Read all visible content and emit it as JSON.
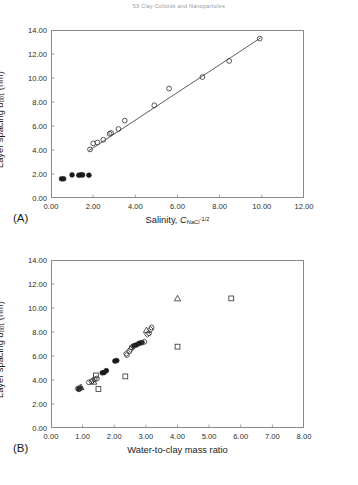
{
  "header": {
    "running_text": "53  Clay Colloids and Nanoparticles"
  },
  "panels": [
    {
      "id": "A",
      "label": "(A)",
      "ylabel_prefix": "Layer spacing ",
      "ylabel_symbol": "d",
      "ylabel_sub": "001",
      "ylabel_units": " (nm)",
      "xlabel_prefix": "Salinity, ",
      "xlabel_symbol": "C",
      "xlabel_sub": "NaCl",
      "xlabel_sup": "-1/2",
      "xticks": [
        "0.00",
        "2.00",
        "4.00",
        "6.00",
        "8.00",
        "10.00",
        "12.00"
      ],
      "yticks": [
        "0.00",
        "2.00",
        "4.00",
        "6.00",
        "8.00",
        "10.00",
        "12.00",
        "14.00"
      ]
    },
    {
      "id": "B",
      "label": "(B)",
      "ylabel_prefix": "Layer spacing ",
      "ylabel_symbol": "d",
      "ylabel_sub": "001",
      "ylabel_units": " (nm)",
      "xlabel_text": "Water-to-clay mass ratio",
      "xticks": [
        "0.00",
        "1.00",
        "2.00",
        "3.00",
        "4.00",
        "5.00",
        "6.00",
        "7.00",
        "8.00"
      ],
      "yticks": [
        "0.00",
        "2.00",
        "4.00",
        "6.00",
        "8.00",
        "10.00",
        "12.00",
        "14.00"
      ]
    }
  ],
  "chart_data": [
    {
      "type": "scatter",
      "panel": "A",
      "title": "",
      "xlabel": "Salinity, C_NaCl^(-1/2)",
      "ylabel": "Layer spacing d_001 (nm)",
      "xlim": [
        0.0,
        12.0
      ],
      "ylim": [
        0.0,
        14.0
      ],
      "xticks": [
        0,
        2,
        4,
        6,
        8,
        10,
        12
      ],
      "yticks": [
        0,
        2,
        4,
        6,
        8,
        10,
        12,
        14
      ],
      "grid": false,
      "legend": "none",
      "series": [
        {
          "name": "open-circle-swelling",
          "marker": "circle-open",
          "points": [
            [
              1.85,
              4.05
            ],
            [
              2.0,
              4.55
            ],
            [
              2.2,
              4.62
            ],
            [
              2.48,
              4.85
            ],
            [
              2.78,
              5.35
            ],
            [
              2.85,
              5.42
            ],
            [
              3.2,
              5.75
            ],
            [
              3.5,
              6.45
            ],
            [
              4.9,
              7.72
            ],
            [
              5.6,
              9.12
            ],
            [
              7.18,
              10.08
            ],
            [
              8.45,
              11.42
            ],
            [
              9.9,
              13.28
            ]
          ]
        },
        {
          "name": "filled-circle-crystalline",
          "marker": "circle-filled",
          "points": [
            [
              0.5,
              1.6
            ],
            [
              0.6,
              1.6
            ],
            [
              1.0,
              1.92
            ],
            [
              1.32,
              1.9
            ],
            [
              1.42,
              1.92
            ],
            [
              1.5,
              1.92
            ],
            [
              1.8,
              1.9
            ]
          ]
        },
        {
          "name": "linear-fit",
          "marker": "line",
          "points": [
            [
              1.8,
              3.95
            ],
            [
              9.95,
              13.35
            ]
          ]
        }
      ]
    },
    {
      "type": "scatter",
      "panel": "B",
      "title": "",
      "xlabel": "Water-to-clay mass ratio",
      "ylabel": "Layer spacing d_001 (nm)",
      "xlim": [
        0.0,
        8.0
      ],
      "ylim": [
        0.0,
        14.0
      ],
      "xticks": [
        0,
        1,
        2,
        3,
        4,
        5,
        6,
        7,
        8
      ],
      "yticks": [
        0,
        2,
        4,
        6,
        8,
        10,
        12,
        14
      ],
      "grid": false,
      "legend": "none",
      "series": [
        {
          "name": "circles-filled",
          "marker": "circle-filled",
          "points": [
            [
              0.88,
              3.22
            ],
            [
              0.92,
              3.3
            ],
            [
              1.62,
              4.6
            ],
            [
              1.68,
              4.62
            ],
            [
              1.75,
              4.78
            ],
            [
              2.02,
              5.58
            ],
            [
              2.08,
              5.62
            ],
            [
              2.62,
              6.85
            ],
            [
              2.7,
              6.92
            ],
            [
              2.78,
              7.05
            ],
            [
              2.88,
              7.12
            ]
          ]
        },
        {
          "name": "circles-open",
          "marker": "circle-open",
          "points": [
            [
              0.85,
              3.28
            ],
            [
              1.2,
              3.8
            ],
            [
              1.28,
              3.88
            ],
            [
              1.38,
              4.05
            ],
            [
              1.45,
              4.12
            ],
            [
              2.4,
              6.08
            ],
            [
              2.48,
              6.4
            ],
            [
              2.55,
              6.72
            ],
            [
              2.95,
              7.18
            ],
            [
              3.1,
              7.9
            ],
            [
              3.18,
              8.38
            ]
          ]
        },
        {
          "name": "diamonds",
          "marker": "diamond-open",
          "points": [
            [
              0.9,
              3.35
            ],
            [
              1.32,
              3.95
            ],
            [
              2.38,
              6.2
            ],
            [
              2.52,
              6.55
            ],
            [
              2.6,
              6.8
            ],
            [
              2.82,
              7.08
            ],
            [
              3.05,
              7.8
            ],
            [
              3.15,
              8.2
            ]
          ]
        },
        {
          "name": "triangles",
          "marker": "triangle-open",
          "points": [
            [
              0.95,
              3.4
            ],
            [
              1.35,
              3.85
            ],
            [
              3.02,
              8.15
            ],
            [
              4.0,
              10.8
            ]
          ]
        },
        {
          "name": "squares",
          "marker": "square-open",
          "points": [
            [
              1.42,
              4.38
            ],
            [
              1.5,
              3.25
            ],
            [
              2.35,
              4.3
            ],
            [
              4.0,
              6.78
            ],
            [
              5.7,
              10.8
            ]
          ]
        }
      ]
    }
  ]
}
